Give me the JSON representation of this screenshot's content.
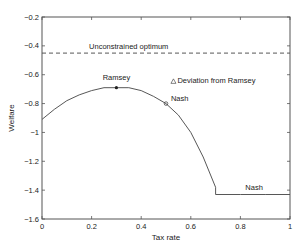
{
  "chart_data": {
    "type": "line",
    "title": "",
    "xlabel": "Tax rate",
    "ylabel": "Welfare",
    "xlim": [
      0,
      1
    ],
    "ylim": [
      -1.6,
      -0.2
    ],
    "xticks": [
      "0",
      "0.2",
      "0.4",
      "0.6",
      "0.8",
      "1"
    ],
    "yticks": [
      "-0.2",
      "-0.4",
      "-0.6",
      "-0.8",
      "-1",
      "-1.2",
      "-1.4",
      "-1.6"
    ],
    "grid": false,
    "series": [
      {
        "name": "Welfare curve",
        "style": "solid",
        "x": [
          0,
          0.05,
          0.1,
          0.15,
          0.2,
          0.25,
          0.3,
          0.35,
          0.4,
          0.45,
          0.5,
          0.55,
          0.6,
          0.65,
          0.7,
          0.7,
          0.8,
          0.9,
          1.0
        ],
        "y": [
          -0.91,
          -0.84,
          -0.78,
          -0.74,
          -0.71,
          -0.69,
          -0.69,
          -0.69,
          -0.71,
          -0.75,
          -0.8,
          -0.88,
          -1.0,
          -1.17,
          -1.38,
          -1.43,
          -1.43,
          -1.43,
          -1.43
        ]
      },
      {
        "name": "Unconstrained optimum",
        "style": "dashed",
        "x": [
          0,
          1
        ],
        "y": [
          -0.45,
          -0.45
        ]
      }
    ],
    "markers": [
      {
        "label": "Ramsey",
        "x": 0.3,
        "y": -0.69,
        "symbol": "dot"
      },
      {
        "label": "Nash",
        "x": 0.5,
        "y": -0.8,
        "symbol": "circle"
      }
    ],
    "annotations": [
      {
        "text": "Unconstrained optimum",
        "x": 0.19,
        "y": -0.42
      },
      {
        "text": "Ramsey",
        "x": 0.3,
        "y": -0.64
      },
      {
        "text": "Deviation from Ramsey",
        "x": 0.53,
        "y": -0.66,
        "symbol": "triangle"
      },
      {
        "text": "Nash",
        "x": 0.52,
        "y": -0.78
      },
      {
        "text": "Nash",
        "x": 0.82,
        "y": -1.4
      }
    ]
  }
}
